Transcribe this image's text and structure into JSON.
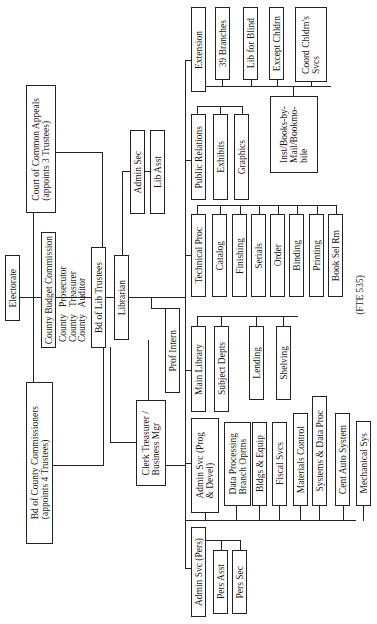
{
  "chart": {
    "footnote": "(FTE 535)",
    "nodes": {
      "electorate": "Electorate",
      "court_of_common_appeals": "Court of Common Appeals\n(appoints 3 Trustees)",
      "county_budget_commission": "County Budget Commission",
      "county_officers": "County   Prosecutor\nCounty   Treasurer\nCounty   Auditor",
      "bd_of_lib_trustees": "Bd of Lib Trustees",
      "bd_of_county_commissioners": "Bd of County Commissioners\n(appoints 4 Trustees)",
      "librarian": "Librarian",
      "admin_sec": "Admin Sec",
      "lib_asst": "Lib Asst",
      "prof_intern": "Prof Intern",
      "clerk_treasurer": "Clerk Treasurer /\nBusiness Mgr",
      "extension": "Extension",
      "branches_39": "39 Branches",
      "lib_for_blind": "Lib for Blind",
      "except_chldrn": "Except Chldrn",
      "coord_chldrns_svcs": "Coord Chldrn's\nSvcs",
      "inst_books_by_mail": "Inst/Books-by-\nMail/Bookmo-\nbile",
      "public_relations": "Public Relations",
      "exhibits": "Exhibits",
      "graphics": "Graphics",
      "technical_proc": "Technical Proc",
      "catalog": "Catalog",
      "finishing": "Finishing",
      "serials": "Serials",
      "order": "Order",
      "binding": "Binding",
      "printing": "Printing",
      "book_sel_rm": "Book Sel Rm",
      "main_library": "Main Library",
      "subject_depts": "Subject Depts",
      "lending": "Lending",
      "shelving": "Shelving",
      "admin_svc_prog": "Admin Svc (Prog\n& Devel)",
      "data_processing": "Data Processing\nBranch Oprtns",
      "bldgs_equip": "Bldgs & Equip",
      "fiscal_svcs": "Fiscal Svcs",
      "materials_control": "Materials Control",
      "systems_data_proc": "Systems & Data Proc",
      "cent_auto_system": "Cent Auto System",
      "mechanical_sys": "Mechanical Sys",
      "admin_svc_pers": "Admin Svc (Pers)",
      "pers_asst": "Pers Asst",
      "pers_sec": "Pers Sec"
    }
  }
}
